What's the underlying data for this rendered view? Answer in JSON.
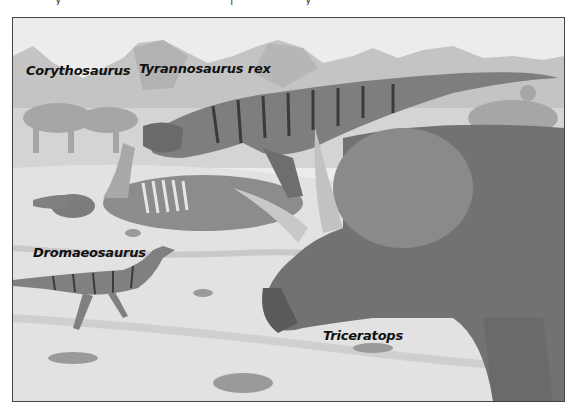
{
  "figure": {
    "type": "illustration",
    "style": "grayscale painted scene",
    "scene": "Late Cretaceous landscape with dinosaurs around a carcass, mountains in the background",
    "labels": [
      {
        "id": "corythosaurus",
        "text": "Corythosaurus"
      },
      {
        "id": "tyrannosaurus",
        "text": "Tyrannosaurus rex"
      },
      {
        "id": "dromaeosaurus",
        "text": "Dromaeosaurus"
      },
      {
        "id": "triceratops",
        "text": "Triceratops"
      }
    ],
    "colors": {
      "sky": "#ececec",
      "mountains": "#bdbdbd",
      "ground": "#dcdcdc",
      "animals": "#7a7a7a",
      "dark": "#3a3a3a",
      "border": "#444444"
    }
  }
}
